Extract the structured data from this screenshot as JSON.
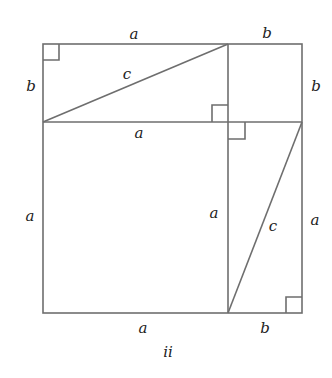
{
  "figure": {
    "caption": "ii",
    "stroke_color": "#6e6e6e",
    "label_color": "#222222"
  },
  "labels": {
    "top_a": "a",
    "top_b": "b",
    "left_b": "b",
    "right_b": "b",
    "hyp_top_c": "c",
    "mid_a": "a",
    "left_a": "a",
    "inner_a": "a",
    "right_a": "a",
    "hyp_right_c": "c",
    "bottom_a": "a",
    "bottom_b": "b"
  }
}
